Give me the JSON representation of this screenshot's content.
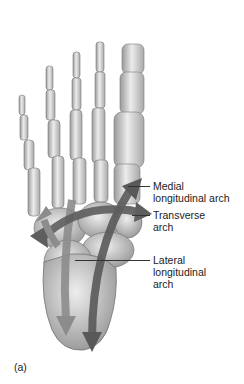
{
  "figure": {
    "panel_label": "(a)",
    "labels": [
      {
        "id": "medial",
        "line1": "Medial",
        "line2": "longitudinal arch",
        "line3": ""
      },
      {
        "id": "transverse",
        "line1": "Transverse",
        "line2": "arch",
        "line3": ""
      },
      {
        "id": "lateral",
        "line1": "Lateral",
        "line2": "longitudinal",
        "line3": "arch"
      }
    ],
    "colors": {
      "bone": "#d9d9d9",
      "bone_shadow": "#8a8a8a",
      "arrow_dark": "#595959",
      "arrow_light": "#8c8c8c",
      "text": "#222222"
    }
  }
}
